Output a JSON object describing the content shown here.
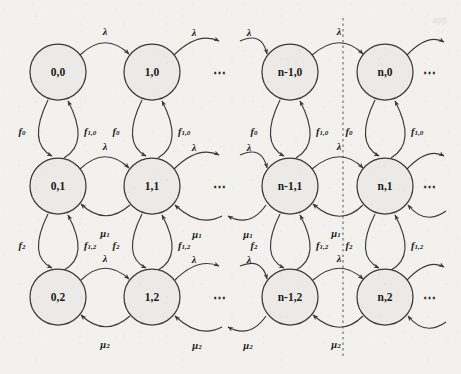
{
  "figure": {
    "type": "markov-chain-state-transition-diagram",
    "background_color": "#f2f1ee",
    "ink_color": "#3a3a38",
    "node_fill": "#eceae6",
    "width": 461,
    "height": 374
  },
  "layout": {
    "column_x": [
      58,
      152,
      290,
      385
    ],
    "row_y": [
      72,
      186,
      297
    ],
    "node_radius": 28,
    "inner_ellipsis_x": 220,
    "trailing_ellipsis_x": 430,
    "cut_line_x": 343,
    "cut_line_y0": 18,
    "cut_line_y1": 356
  },
  "columns": [
    {
      "key": "c0",
      "index_label": "0"
    },
    {
      "key": "c1",
      "index_label": "1"
    },
    {
      "key": "cnm1",
      "index_label": "n-1"
    },
    {
      "key": "cn",
      "index_label": "n"
    }
  ],
  "rows": [
    {
      "key": "r0",
      "phase_label": "0"
    },
    {
      "key": "r1",
      "phase_label": "1"
    },
    {
      "key": "r2",
      "phase_label": "2"
    }
  ],
  "nodes": [
    {
      "id": "n-0-0",
      "label": "0,0",
      "col": 0,
      "row": 0
    },
    {
      "id": "n-1-0",
      "label": "1,0",
      "col": 1,
      "row": 0
    },
    {
      "id": "n-nm1-0",
      "label": "n-1,0",
      "col": 2,
      "row": 0
    },
    {
      "id": "n-n-0",
      "label": "n,0",
      "col": 3,
      "row": 0
    },
    {
      "id": "n-0-1",
      "label": "0,1",
      "col": 0,
      "row": 1
    },
    {
      "id": "n-1-1",
      "label": "1,1",
      "col": 1,
      "row": 1
    },
    {
      "id": "n-nm1-1",
      "label": "n-1,1",
      "col": 2,
      "row": 1
    },
    {
      "id": "n-n-1",
      "label": "n,1",
      "col": 3,
      "row": 1
    },
    {
      "id": "n-0-2",
      "label": "0,2",
      "col": 0,
      "row": 2
    },
    {
      "id": "n-1-2",
      "label": "1,2",
      "col": 1,
      "row": 2
    },
    {
      "id": "n-nm1-2",
      "label": "n-1,2",
      "col": 2,
      "row": 2
    },
    {
      "id": "n-n-2",
      "label": "n,2",
      "col": 3,
      "row": 2
    }
  ],
  "rate_labels": {
    "lambda": "λ",
    "mu1_base": "μ",
    "mu1_sub": "1",
    "mu2_base": "μ",
    "mu2_sub": "2",
    "f0_base": "f",
    "f0_sub": "0",
    "f10_base": "f",
    "f10_sub": "1,0",
    "f2_base": "f",
    "f2_sub": "2",
    "f12_base": "f",
    "f12_sub": "1,2"
  },
  "ellipses": {
    "glyph": "⋯",
    "row0_inner": "⋯",
    "row1_inner": "⋯",
    "row2_inner": "⋯",
    "row0_trailing": "⋯",
    "row1_trailing": "⋯",
    "row2_trailing": "⋯"
  },
  "edges": {
    "horizontal_forward_rate": "λ",
    "horizontal_backward_row1_rate": "μ1",
    "horizontal_backward_row2_rate": "μ2",
    "vertical_down_01_rate": "f0",
    "vertical_up_10_rate": "f1,0",
    "vertical_down_12_rate": "f2",
    "vertical_up_21_rate": "f1,2"
  },
  "ghost_text": {
    "top_right": "app"
  }
}
